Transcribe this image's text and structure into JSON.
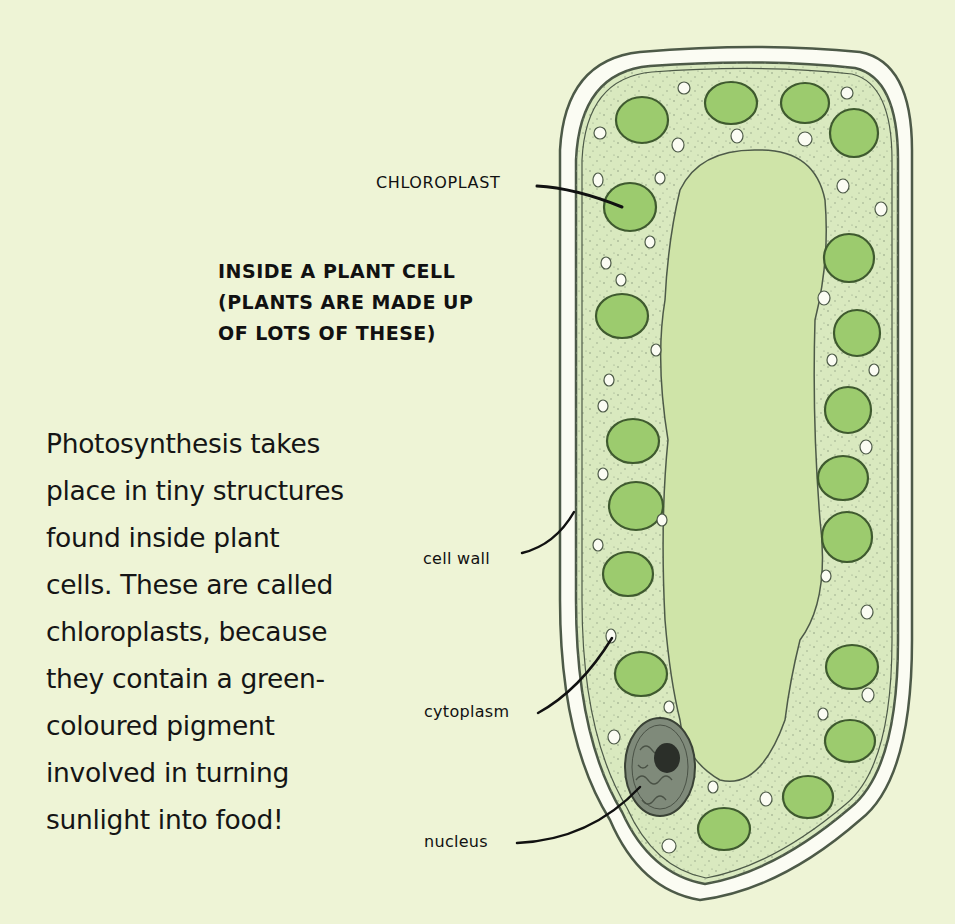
{
  "diagram": {
    "title_lines": [
      "INSIDE A PLANT CELL",
      "(PLANTS ARE MADE UP",
      "OF LOTS OF THESE)"
    ],
    "labels": {
      "chloroplast": "CHLOROPLAST",
      "cell_wall": "cell wall",
      "cytoplasm": "cytoplasm",
      "nucleus": "nucleus"
    },
    "body_lines": [
      "Photosynthesis takes",
      "place in tiny structures",
      "found inside plant",
      "cells. These are called",
      "chloroplasts, because",
      "they contain a green-",
      "coloured pigment",
      "involved in turning",
      "sunlight into food!"
    ],
    "colors": {
      "background": "#eef4d6",
      "cell_wall_fill": "#fbfcf3",
      "cytoplasm": "#d9e9bf",
      "vacuole": "#cfe4a8",
      "chloroplast": "#9ccb6e",
      "outline": "#4d5a48",
      "nucleus": "#7f8a7a",
      "nucleolus": "#2b2f29"
    }
  }
}
